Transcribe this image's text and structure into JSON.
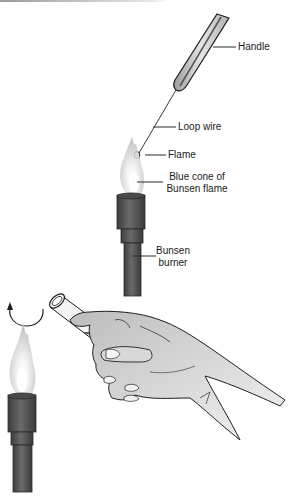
{
  "figure": {
    "panels": [
      {
        "name": "loop-sterilization",
        "labels": {
          "handle": "Handle",
          "loop_wire": "Loop wire",
          "flame": "Flame",
          "blue_cone_line1": "Blue cone of",
          "blue_cone_line2": "Bunsen flame",
          "burner_line1": "Bunsen",
          "burner_line2": "burner"
        }
      },
      {
        "name": "test-tube-flaming",
        "labels": {}
      }
    ],
    "colors": {
      "burner": "#5a5a5a",
      "burner_dark": "#3a3a3a",
      "flame_outer": "#c8c8c8",
      "flame_inner": "#ffffff",
      "line": "#2a2a2a",
      "hand": "#d4d4d4"
    }
  }
}
